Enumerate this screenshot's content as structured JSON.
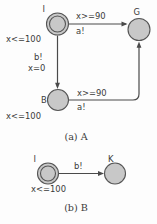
{
  "figure": {
    "background_color": "#fdfdfd",
    "node_fill": "#c8c8c8",
    "node_stroke": "#555555",
    "edge_color": "#4a4a4a",
    "text_color": "#3a3a3a"
  },
  "diagram_a": {
    "caption": "(a) A",
    "nodes": [
      {
        "id": "I",
        "label": "I",
        "invariant": "x<=100",
        "initial": true
      },
      {
        "id": "G",
        "label": "G",
        "invariant": "",
        "initial": false
      },
      {
        "id": "B",
        "label": "B",
        "invariant": "x<=100",
        "initial": false
      }
    ],
    "edges": [
      {
        "from": "I",
        "to": "G",
        "guard": "x>=90",
        "action": "a!"
      },
      {
        "from": "I",
        "to": "B",
        "guard": "b!",
        "action": "x=0"
      },
      {
        "from": "B",
        "to": "G",
        "guard": "x>=90",
        "action": "a!"
      }
    ]
  },
  "diagram_b": {
    "caption": "(b) B",
    "nodes": [
      {
        "id": "I",
        "label": "I",
        "invariant": "x<=100",
        "initial": true
      },
      {
        "id": "K",
        "label": "K",
        "invariant": "",
        "initial": false
      }
    ],
    "edges": [
      {
        "from": "I",
        "to": "K",
        "guard": "b!",
        "action": ""
      }
    ]
  }
}
